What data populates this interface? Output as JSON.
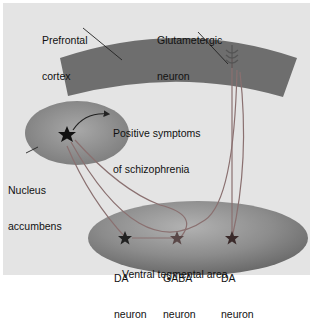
{
  "diagram": {
    "regions": {
      "prefrontal_cortex": {
        "label_line1": "Prefrontal",
        "label_line2": "cortex",
        "color": "#6e6e6e"
      },
      "nucleus_accumbens": {
        "label_line1": "Nucleus",
        "label_line2": "accumbens",
        "color": "#8a8a8a"
      },
      "ventral_tegmental_area": {
        "label": "Ventral tegmental area",
        "color": "#7a7a7a"
      }
    },
    "neurons": {
      "glutamatergic": {
        "label_line1": "Glutametergic",
        "label_line2": "neuron"
      },
      "da_left": {
        "label_line1": "DA",
        "label_line2": "neuron"
      },
      "gaba": {
        "label_line1": "GABA",
        "label_line2": "neuron"
      },
      "da_right": {
        "label_line1": "DA",
        "label_line2": "neuron"
      }
    },
    "annotation": {
      "line1": "Positive symptoms",
      "line2": "of schizophrenia"
    },
    "colors": {
      "background": "#e4e4e4",
      "pathway": "#8a7070",
      "star_dark": "#1a1a1a",
      "star_mid": "#5a4848"
    }
  }
}
